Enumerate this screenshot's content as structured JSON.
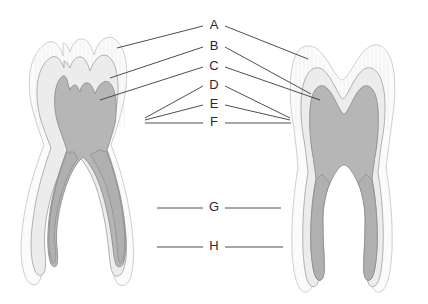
{
  "diagram": {
    "kind": "labeled-anatomical-figure",
    "background_color": "#ffffff",
    "line_color": "#3a3a3a",
    "text_color": "#2b2b2b",
    "labels": [
      {
        "id": "A",
        "text": "A",
        "x": 214,
        "y": 26
      },
      {
        "id": "B",
        "text": "B",
        "x": 214,
        "y": 47
      },
      {
        "id": "C",
        "text": "C",
        "x": 214,
        "y": 67
      },
      {
        "id": "D",
        "text": "D",
        "x": 214,
        "y": 86
      },
      {
        "id": "E",
        "text": "E",
        "x": 214,
        "y": 105
      },
      {
        "id": "F",
        "text": "F",
        "x": 214,
        "y": 123
      },
      {
        "id": "G",
        "text": "G",
        "x": 214,
        "y": 208
      },
      {
        "id": "H",
        "text": "H",
        "x": 214,
        "y": 247
      }
    ],
    "figures": [
      {
        "id": "left-tooth",
        "name": "molar-cross-section-left",
        "crown_cusps": 4,
        "roots": 2,
        "root_shape": "divergent-curved"
      },
      {
        "id": "right-tooth",
        "name": "molar-cross-section-right",
        "crown_cusps": 2,
        "roots": 2,
        "root_shape": "parallel-vertical"
      }
    ],
    "layers": [
      {
        "name": "enamel",
        "color": "#fbfbfb",
        "stroke": "#c8c8c8"
      },
      {
        "name": "dentin",
        "color": "#ececec",
        "stroke": "#a9a9a9"
      },
      {
        "name": "pulp",
        "color": "#b6b6b6",
        "stroke": "#8f8f8f"
      },
      {
        "name": "root-canal",
        "color": "#b0b0b0",
        "stroke": "#8f8f8f"
      }
    ]
  }
}
